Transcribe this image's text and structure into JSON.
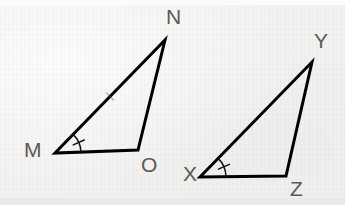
{
  "figure": {
    "background_color": "#f2f2f0",
    "stroke_color": "#000000",
    "label_color": "#5a5a5c",
    "stroke_width": 3
  },
  "triangles": [
    {
      "name": "MNO",
      "vertices": [
        {
          "label": "M",
          "x": 55,
          "y": 153,
          "label_x": 24,
          "label_y": 139
        },
        {
          "label": "N",
          "x": 165,
          "y": 40,
          "label_x": 166,
          "label_y": 6
        },
        {
          "label": "O",
          "x": 138,
          "y": 150,
          "label_x": 141,
          "label_y": 154
        }
      ],
      "sides": [
        {
          "from": "M",
          "to": "N",
          "tick_marks": 1
        },
        {
          "from": "N",
          "to": "O",
          "tick_marks": 0
        },
        {
          "from": "M",
          "to": "O",
          "tick_marks": 0
        }
      ],
      "marked_angle": {
        "at": "M",
        "arc_tick_marks": 1,
        "arc_radius": 26
      }
    },
    {
      "name": "XYZ",
      "vertices": [
        {
          "label": "X",
          "x": 200,
          "y": 177,
          "label_x": 183,
          "label_y": 163
        },
        {
          "label": "Y",
          "x": 312,
          "y": 62,
          "label_x": 314,
          "label_y": 30
        },
        {
          "label": "Z",
          "x": 286,
          "y": 176,
          "label_x": 290,
          "label_y": 178
        }
      ],
      "sides": [
        {
          "from": "X",
          "to": "Y",
          "tick_marks": 0
        },
        {
          "from": "Y",
          "to": "Z",
          "tick_marks": 0
        },
        {
          "from": "X",
          "to": "Z",
          "tick_marks": 0
        }
      ],
      "marked_angle": {
        "at": "X",
        "arc_tick_marks": 1,
        "arc_radius": 26
      }
    }
  ]
}
